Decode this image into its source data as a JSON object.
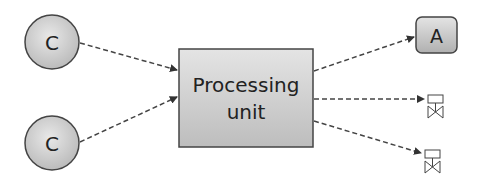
{
  "diagram": {
    "processing_unit": {
      "label_line1": "Processing",
      "label_line2": "unit"
    },
    "inputs": [
      {
        "label": "C"
      },
      {
        "label": "C"
      }
    ],
    "outputs": [
      {
        "type": "actuator",
        "label": "A"
      },
      {
        "type": "valve"
      },
      {
        "type": "valve"
      }
    ],
    "colors": {
      "stroke": "#444444",
      "fill_light": "#e6e6e6",
      "fill_dark": "#bdbdbd",
      "arrow": "#444444"
    }
  }
}
